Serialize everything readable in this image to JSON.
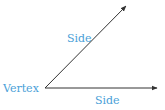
{
  "diagram": {
    "vertex_label": "Vertex",
    "side_upper_label": "Side",
    "side_lower_label": "Side",
    "colors": {
      "label": "#4a9fd8",
      "ray": "#333333"
    },
    "geometry": {
      "vertex": [
        45,
        88
      ],
      "upper_ray_end": [
        126,
        6
      ],
      "lower_ray_end": [
        157,
        88
      ]
    }
  }
}
